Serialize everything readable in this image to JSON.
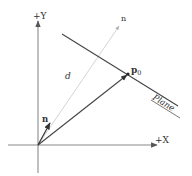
{
  "diagram": {
    "axes": {
      "x_label": "+X",
      "y_label": "+Y"
    },
    "labels": {
      "normal_short": "n",
      "normal_direction": "n",
      "point": "p",
      "point_subscript": "0",
      "distance": "d",
      "plane": "Plane"
    },
    "colors": {
      "axis": "#777777",
      "vector": "#333333",
      "plane": "#444444",
      "guide": "#c8c8c8",
      "text": "#333333"
    }
  }
}
